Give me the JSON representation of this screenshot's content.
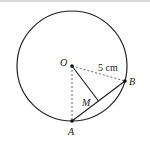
{
  "diagram": {
    "type": "geometry-circle-chord",
    "circle": {
      "center": "O",
      "radius_label": "5 cm"
    },
    "points": {
      "O": {
        "label": "O"
      },
      "A": {
        "label": "A"
      },
      "B": {
        "label": "B"
      },
      "M": {
        "label": "M"
      }
    },
    "segments": [
      {
        "from": "O",
        "to": "B",
        "style": "dashed",
        "label": "5 cm"
      },
      {
        "from": "O",
        "to": "A",
        "style": "dashed"
      },
      {
        "from": "O",
        "to": "M",
        "style": "solid"
      },
      {
        "from": "A",
        "to": "B",
        "style": "solid",
        "note": "chord"
      }
    ],
    "colors": {
      "stroke": "#222222",
      "background": "#ffffff"
    }
  }
}
